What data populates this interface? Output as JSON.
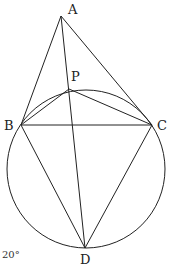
{
  "figure": {
    "points": {
      "A": {
        "label": "A",
        "x": 61,
        "y": 16
      },
      "P": {
        "label": "P",
        "x": 69,
        "y": 89
      },
      "B": {
        "label": "B",
        "x": 21,
        "y": 125
      },
      "C": {
        "label": "C",
        "x": 152,
        "y": 125
      },
      "D": {
        "label": "D",
        "x": 85,
        "y": 248
      }
    },
    "circle": {
      "cx": 86,
      "cy": 169,
      "r": 79
    },
    "segments": [
      "AB",
      "AC",
      "AD",
      "BC",
      "PB",
      "PC",
      "BD",
      "CD"
    ],
    "angle_note": "20°"
  }
}
